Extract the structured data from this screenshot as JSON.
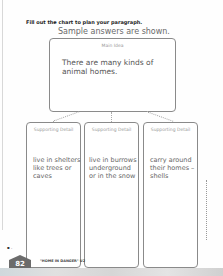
{
  "worksheet": {
    "instruction": "Fill out the chart to plan your paragraph.",
    "sample_note": "Sample answers are shown.",
    "main_idea": {
      "label": "Main Idea",
      "text": "There are many kinds of animal homes."
    },
    "supporting_details": [
      {
        "label": "Supporting Detail",
        "text": "live in shelters like trees or caves"
      },
      {
        "label": "Supporting Detail",
        "text": "live in burrows underground or in the snow"
      },
      {
        "label": "Supporting Detail",
        "text": "carry around their homes – shells"
      }
    ]
  },
  "footer": {
    "page_number": "82",
    "unit_text": "\"HOME IN DANGER\" U2",
    "marks": "▪ ."
  }
}
